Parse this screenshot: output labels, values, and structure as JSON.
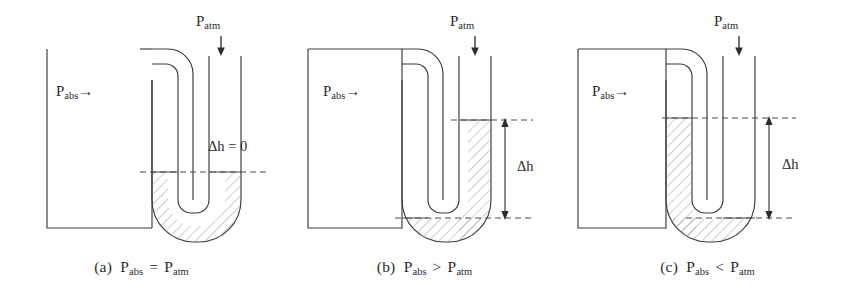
{
  "figure": {
    "background_color": "#ffffff",
    "line_color": "#3a3a3a",
    "hatch_color": "#6e6e6e",
    "text_color": "#2b2b2b",
    "panel_count": 3
  },
  "symbols": {
    "p_letter": "P",
    "sub_abs": "abs",
    "sub_atm": "atm",
    "delta_h": "Δh",
    "arrow_right": "→",
    "arrow_down": "↓"
  },
  "panels": [
    {
      "id": "a",
      "caption_index": "(a)",
      "caption_operator": "=",
      "caption_full": "(a) Pabs = Patm",
      "tank_label": "P",
      "tank_label_sub": "abs",
      "tank_label_arrow": "→",
      "atm_label": "P",
      "atm_label_sub": "atm",
      "atm_label_arrow": "↓",
      "height_label": "Δh = 0",
      "height_value": 0,
      "tank_top_closed": false,
      "left_limb_level_px": 172,
      "right_limb_level_px": 172,
      "level_relation": "equal",
      "dimension_arrow": "none",
      "dashed_reference_lines": 1
    },
    {
      "id": "b",
      "caption_index": "(b)",
      "caption_operator": ">",
      "caption_full": "(b) Pabs > Patm",
      "tank_label": "P",
      "tank_label_sub": "abs",
      "tank_label_arrow": "→",
      "atm_label": "P",
      "atm_label_sub": "atm",
      "atm_label_arrow": "↓",
      "height_label": "Δh",
      "tank_top_closed": true,
      "left_limb_level_px": 218,
      "right_limb_level_px": 120,
      "level_relation": "right-higher",
      "dimension_arrow": "double-headed-vertical",
      "dashed_reference_lines": 2
    },
    {
      "id": "c",
      "caption_index": "(c)",
      "caption_operator": "<",
      "caption_full": "(c) Pabs < Patm",
      "tank_label": "P",
      "tank_label_sub": "abs",
      "tank_label_arrow": "→",
      "atm_label": "P",
      "atm_label_sub": "atm",
      "atm_label_arrow": "↓",
      "height_label": "Δh",
      "tank_top_closed": true,
      "left_limb_level_px": 118,
      "right_limb_level_px": 218,
      "level_relation": "left-higher",
      "dimension_arrow": "double-headed-vertical",
      "dashed_reference_lines": 2
    }
  ]
}
